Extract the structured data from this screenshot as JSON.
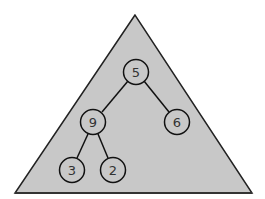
{
  "diagram": {
    "type": "binary-tree-in-triangle",
    "triangle": {
      "apex": [
        135,
        15
      ],
      "base_left": [
        15,
        193
      ],
      "base_right": [
        252,
        193
      ],
      "fill": "#c8c8c8",
      "stroke": "#222222"
    },
    "nodes": [
      {
        "id": "n5",
        "label": "5",
        "cx": 136,
        "cy": 72
      },
      {
        "id": "n9",
        "label": "9",
        "cx": 93,
        "cy": 122
      },
      {
        "id": "n6",
        "label": "6",
        "cx": 177,
        "cy": 122
      },
      {
        "id": "n3",
        "label": "3",
        "cx": 72,
        "cy": 170
      },
      {
        "id": "n2",
        "label": "2",
        "cx": 113,
        "cy": 170
      }
    ],
    "edges": [
      {
        "from": "n5",
        "to": "n9"
      },
      {
        "from": "n5",
        "to": "n6"
      },
      {
        "from": "n9",
        "to": "n3"
      },
      {
        "from": "n9",
        "to": "n2"
      }
    ],
    "node_radius": 12.5,
    "node_fill": "#c8c8c8",
    "node_stroke": "#111111"
  }
}
